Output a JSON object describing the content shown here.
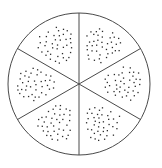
{
  "canvas": {
    "width": 162,
    "height": 168,
    "background_color": "#ffffff"
  },
  "figure": {
    "name": "circle-divided-into-six-sectors-with-dot-stipple",
    "type": "fraction-circle-diagram",
    "sector_count": 6,
    "shaded_sector_count": 6,
    "fill_style": "dot-stipple",
    "circle": {
      "center_x": 79,
      "center_y": 84,
      "radius": 71,
      "stroke_color": "#4a4a4a",
      "stroke_width": 1,
      "fill_color": "#ffffff"
    },
    "divider_lines": {
      "count": 3,
      "angles_deg": [
        90,
        30,
        150
      ],
      "stroke_color": "#4a4a4a",
      "stroke_width": 1
    },
    "dots": {
      "color": "#2b2b2b",
      "size": 1.3,
      "shape": "square",
      "per_sector_count": 40
    },
    "sectors": [
      {
        "id": "sector-top-left",
        "label": "top-left",
        "start_angle_deg": 90,
        "end_angle_deg": 150,
        "centroid_x": 57,
        "centroid_y": 45,
        "dot_count": 40,
        "cluster_radius": 20
      },
      {
        "id": "sector-top-right",
        "label": "top-right",
        "start_angle_deg": 30,
        "end_angle_deg": 90,
        "centroid_x": 101,
        "centroid_y": 45,
        "dot_count": 40,
        "cluster_radius": 20
      },
      {
        "id": "sector-right",
        "label": "right",
        "start_angle_deg": -30,
        "end_angle_deg": 30,
        "centroid_x": 123,
        "centroid_y": 84,
        "dot_count": 40,
        "cluster_radius": 20
      },
      {
        "id": "sector-bottom-right",
        "label": "bottom-right",
        "start_angle_deg": -90,
        "end_angle_deg": -30,
        "centroid_x": 101,
        "centroid_y": 123,
        "dot_count": 40,
        "cluster_radius": 20
      },
      {
        "id": "sector-bottom-left",
        "label": "bottom-left",
        "start_angle_deg": -150,
        "end_angle_deg": -90,
        "centroid_x": 57,
        "centroid_y": 123,
        "dot_count": 40,
        "cluster_radius": 20
      },
      {
        "id": "sector-left",
        "label": "left",
        "start_angle_deg": 150,
        "end_angle_deg": 210,
        "centroid_x": 35,
        "centroid_y": 84,
        "dot_count": 40,
        "cluster_radius": 20
      }
    ]
  }
}
